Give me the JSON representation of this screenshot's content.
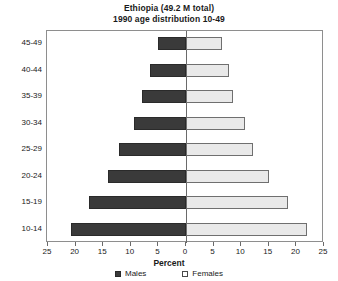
{
  "chart_data": {
    "type": "bar",
    "title": "Ethiopia (49.2 M total)",
    "subtitle": "1990 age distribution 10-49",
    "title_lines": [
      "Ethiopia (49.2 M total)",
      "1990 age distribution 10-49"
    ],
    "orientation": "horizontal",
    "layout": "population-pyramid",
    "xlabel": "Percent",
    "ylabel": "",
    "grid": false,
    "legend_position": "bottom",
    "xlim": [
      -25,
      25
    ],
    "xtick_labels": [
      "25",
      "20",
      "15",
      "10",
      "5",
      "0",
      "5",
      "10",
      "15",
      "20",
      "25"
    ],
    "xtick_values": [
      -25,
      -20,
      -15,
      -10,
      -5,
      0,
      5,
      10,
      15,
      20,
      25
    ],
    "categories": [
      "45-49",
      "40-44",
      "35-39",
      "30-34",
      "25-29",
      "20-24",
      "15-19",
      "10-14"
    ],
    "series": [
      {
        "name": "Males",
        "side": "left",
        "color": "#3a3a3a",
        "values": [
          5.0,
          6.6,
          7.9,
          9.5,
          12.2,
          14.2,
          17.6,
          20.8
        ]
      },
      {
        "name": "Females",
        "side": "right",
        "color": "#e9e9e9",
        "values": [
          6.5,
          7.7,
          8.6,
          10.6,
          12.1,
          15.1,
          18.5,
          21.9
        ]
      }
    ],
    "legend": [
      {
        "label": "Males",
        "marker": "filled-square",
        "color": "#3a3a3a"
      },
      {
        "label": "Females",
        "marker": "open-square",
        "color": "#ffffff"
      }
    ]
  }
}
